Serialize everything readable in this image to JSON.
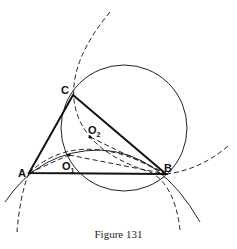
{
  "figure": {
    "caption": "Figure 131",
    "points": {
      "A": {
        "label": "A",
        "x": 29,
        "y": 173
      },
      "B": {
        "label": "B",
        "x": 166,
        "y": 174
      },
      "C": {
        "label": "C",
        "x": 73,
        "y": 95
      },
      "O1": {
        "label": "O",
        "sub": "1",
        "x": 69,
        "y": 155
      },
      "O2": {
        "label": "O",
        "sub": "2",
        "x": 90,
        "y": 137
      }
    },
    "elements": [
      "triangle ABC (thick)",
      "circle through C and B (solid)",
      "dashed arcs through A and B",
      "solid arc through A and B",
      "dashed segments A–O2, O2–B, A–O1, O1–B"
    ]
  }
}
